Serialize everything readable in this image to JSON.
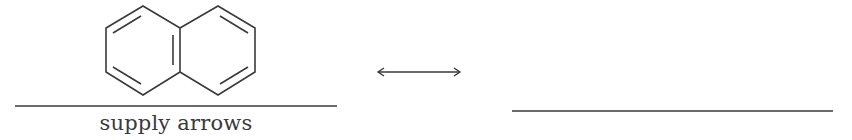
{
  "diagram": {
    "molecule": {
      "name": "naphthalene",
      "stroke_color": "#3a3a3a"
    },
    "left_answer_line": {
      "x1": 15,
      "x2": 337,
      "y": 106
    },
    "caption": "supply arrows",
    "resonance_arrow": {
      "x1": 377,
      "x2": 461,
      "y": 72,
      "type": "double-headed"
    },
    "right_answer_line": {
      "x1": 512,
      "x2": 833,
      "y": 111
    }
  }
}
